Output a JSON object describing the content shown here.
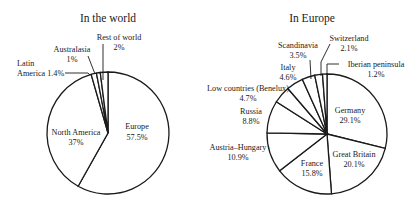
{
  "chart_data": [
    {
      "type": "pie",
      "title": "In the world",
      "center": [
        108,
        133
      ],
      "radius": 61,
      "start_angle_deg": 0,
      "direction": "clockwise",
      "slices": [
        {
          "label": "Europe",
          "value": 57.5,
          "display": "57.5%",
          "label_pos": [
            205,
            89
          ],
          "label_lines": [
            "Europe",
            "57.5%"
          ]
        },
        {
          "label": "North America",
          "value": 37,
          "display": "37%",
          "label_pos": [
            76,
            33
          ],
          "label_lines": [
            "North America",
            "37%"
          ]
        },
        {
          "label": "Latin America",
          "value": 1.4,
          "display": "1.4%",
          "label_pos": [
            0,
            0
          ],
          "label_lines": [
            "Latin",
            "America 1.4%"
          ]
        },
        {
          "label": "Australasia",
          "value": 1,
          "display": "1%",
          "label_pos": [
            0,
            0
          ],
          "label_lines": [
            "Australasia",
            "1%"
          ]
        },
        {
          "label": "Rest of world",
          "value": 2,
          "display": "2%",
          "label_pos": [
            0,
            0
          ],
          "label_lines": [
            "Rest of world",
            "2%"
          ]
        }
      ]
    },
    {
      "type": "pie",
      "title": "In Europe",
      "center": [
        327,
        134
      ],
      "radius": 60,
      "start_angle_deg": 0,
      "direction": "clockwise",
      "slices": [
        {
          "label": "Germany",
          "value": 29.1,
          "display": "29.1%"
        },
        {
          "label": "Great Britain",
          "value": 20.1,
          "display": "20.1%"
        },
        {
          "label": "France",
          "value": 15.8,
          "display": "15.8%"
        },
        {
          "label": "Austria–Hungary",
          "value": 10.9,
          "display": "10.9%"
        },
        {
          "label": "Russia",
          "value": 8.8,
          "display": "8.8%"
        },
        {
          "label": "Low countries (Benelux)",
          "value": 4.7,
          "display": "4.7%"
        },
        {
          "label": "Italy",
          "value": 4.6,
          "display": "4.6%"
        },
        {
          "label": "Scandinavia",
          "value": 3.5,
          "display": "3.5%"
        },
        {
          "label": "Switzerland",
          "value": 2.1,
          "display": "2.1%"
        },
        {
          "label": "Iberian peninsula",
          "value": 1.2,
          "display": "1.2%"
        }
      ]
    }
  ],
  "titles": {
    "world": "In the world",
    "europe": "In Europe"
  },
  "world_labels": {
    "europe_name": "Europe",
    "europe_pct": "57.5%",
    "na_name": "North America",
    "na_pct": "37%",
    "latin_line1": "Latin",
    "latin_line2": "America 1.4%",
    "austral_name": "Australasia",
    "austral_pct": "1%",
    "rest_name": "Rest of world",
    "rest_pct": "2%"
  },
  "europe_labels": {
    "germany_name": "Germany",
    "germany_pct": "29.1%",
    "gb_name": "Great Britain",
    "gb_pct": "20.1%",
    "france_name": "France",
    "france_pct": "15.8%",
    "austria_name": "Austria–Hungary",
    "austria_pct": "10.9%",
    "russia_name": "Russia",
    "russia_pct": "8.8%",
    "benelux_name": "Low countries (Benelux)",
    "benelux_pct": "4.7%",
    "italy_name": "Italy",
    "italy_pct": "4.6%",
    "scand_name": "Scandinavia",
    "scand_pct": "3.5%",
    "swiss_name": "Switzerland",
    "swiss_pct": "2.1%",
    "iberia_name": "Iberian peninsula",
    "iberia_pct": "1.2%"
  }
}
